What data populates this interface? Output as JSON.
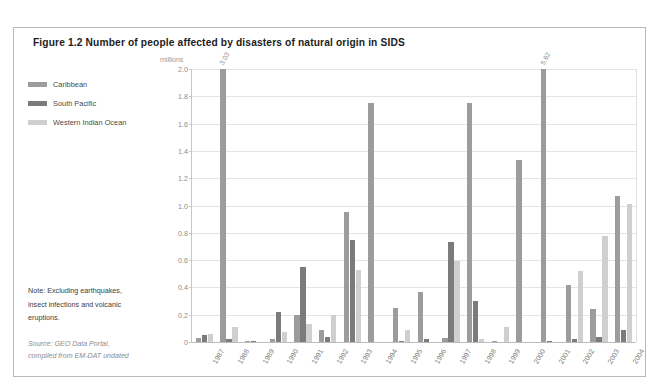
{
  "figure": {
    "title": "Figure 1.2 Number of people affected by disasters of natural origin in SIDS",
    "note_lines": [
      "Note: Excluding earthquakes,",
      "insect infections and volcanic",
      "eruptions."
    ],
    "source_lines": [
      "Source: GEO Data Portal,",
      "compiled from EM-DAT undated"
    ]
  },
  "colors": {
    "caribbean": "#9c9c9c",
    "south_pacific": "#7b7b7b",
    "western_indian_ocean": "#cfcfcf",
    "frame": "#b9b9b9",
    "grid": "#e4e4e4",
    "text": "#3d3d3d",
    "muted": "#8e8e8e"
  },
  "legend": {
    "items": [
      {
        "label": "Caribbean",
        "key": "caribbean"
      },
      {
        "label": "South Pacific",
        "key": "south-pacific"
      },
      {
        "label": "Western Indian Ocean",
        "key": "western-indian-ocean"
      }
    ]
  },
  "chart_data": {
    "type": "bar",
    "title": "Figure 1.2 Number of people affected by disasters of natural origin in SIDS",
    "xlabel": "",
    "ylabel": "millions",
    "ylim": [
      0,
      2.0
    ],
    "yticks": [
      "0",
      "0.2",
      "0.4",
      "0.6",
      "0.8",
      "1.0",
      "1.2",
      "1.4",
      "1.6",
      "1.8",
      "2.0"
    ],
    "grid": true,
    "legend_position": "left",
    "note": "Bars for 1988 and 2001 Caribbean exceed the axis maximum and are annotated with their true values (3.03 and 5.92 millions).",
    "categories": [
      "1987",
      "1988",
      "1989",
      "1990",
      "1991",
      "1992",
      "1993",
      "1994",
      "1995",
      "1996",
      "1997",
      "1998",
      "1999",
      "2000",
      "2001",
      "2002",
      "2003",
      "2004"
    ],
    "series": [
      {
        "name": "Caribbean",
        "key": "caribbean",
        "values": [
          0.03,
          3.03,
          0.01,
          0.02,
          0.2,
          0.09,
          0.95,
          1.75,
          0.25,
          0.37,
          0.03,
          1.75,
          0.01,
          1.33,
          5.92,
          0.42,
          0.24,
          1.07
        ],
        "clipped_labels": {
          "1988": "3.03",
          "2001": "5.92"
        }
      },
      {
        "name": "South Pacific",
        "key": "south-pacific",
        "values": [
          0.05,
          0.02,
          0.01,
          0.22,
          0.55,
          0.04,
          0.75,
          0.0,
          0.01,
          0.02,
          0.73,
          0.3,
          0.0,
          0.0,
          0.01,
          0.02,
          0.04,
          0.09
        ],
        "clipped_labels": {}
      },
      {
        "name": "Western Indian Ocean",
        "key": "western-indian-ocean",
        "values": [
          0.06,
          0.11,
          0.0,
          0.07,
          0.13,
          0.2,
          0.53,
          0.0,
          0.09,
          0.0,
          0.59,
          0.02,
          0.11,
          0.0,
          0.0,
          0.52,
          0.78,
          1.01
        ],
        "clipped_labels": {}
      }
    ]
  }
}
